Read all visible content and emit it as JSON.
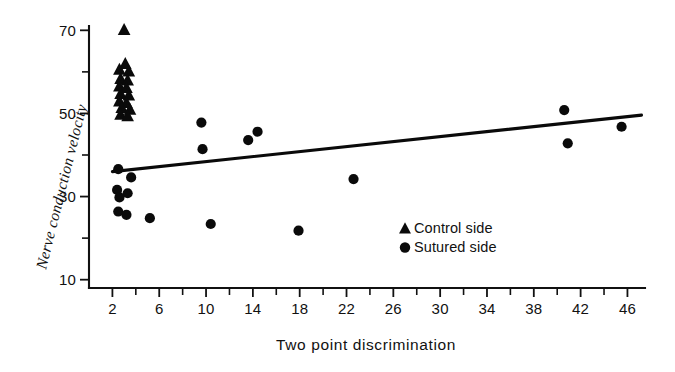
{
  "chart_data": {
    "type": "scatter",
    "title": "",
    "xlabel": "Two point discrimination",
    "ylabel": "Nerve conduction velocity",
    "xlim": [
      0,
      47.5
    ],
    "ylim": [
      8,
      72
    ],
    "grid": false,
    "legend_position": "inside-bottom-right",
    "x_ticks_labeled": [
      2,
      6,
      10,
      14,
      18,
      22,
      26,
      30,
      34,
      38,
      42,
      46
    ],
    "x_ticks_minor": [
      4,
      8,
      12,
      16,
      20,
      24,
      28,
      32,
      36,
      40,
      44
    ],
    "y_ticks_labeled": [
      10,
      30,
      50,
      70
    ],
    "y_ticks_minor": [
      20,
      40,
      60
    ],
    "x_tick_labels": [
      "2",
      "6",
      "10",
      "14",
      "18",
      "22",
      "26",
      "30",
      "34",
      "38",
      "42",
      "46"
    ],
    "y_tick_labels": [
      "10",
      "30",
      "50",
      "70"
    ],
    "series": [
      {
        "name": "Control side",
        "marker": "triangle",
        "color": "#0a0a0a",
        "points": [
          [
            3.0,
            70.2
          ],
          [
            3.1,
            62.0
          ],
          [
            2.6,
            60.6
          ],
          [
            3.4,
            60.2
          ],
          [
            2.7,
            58.4
          ],
          [
            3.3,
            58.0
          ],
          [
            2.6,
            56.6
          ],
          [
            3.2,
            56.2
          ],
          [
            2.7,
            54.8
          ],
          [
            3.4,
            54.4
          ],
          [
            2.6,
            53.0
          ],
          [
            3.2,
            52.6
          ],
          [
            2.8,
            51.4
          ],
          [
            3.5,
            51.0
          ],
          [
            2.7,
            49.8
          ],
          [
            3.3,
            49.4
          ]
        ]
      },
      {
        "name": "Sutured side",
        "marker": "circle",
        "color": "#0a0a0a",
        "points": [
          [
            2.5,
            36.6
          ],
          [
            3.6,
            34.6
          ],
          [
            2.4,
            31.6
          ],
          [
            3.3,
            30.8
          ],
          [
            2.6,
            29.8
          ],
          [
            2.5,
            26.4
          ],
          [
            3.2,
            25.6
          ],
          [
            5.2,
            24.8
          ],
          [
            9.6,
            47.8
          ],
          [
            9.7,
            41.4
          ],
          [
            10.4,
            23.4
          ],
          [
            13.6,
            43.6
          ],
          [
            14.4,
            45.6
          ],
          [
            17.9,
            21.8
          ],
          [
            22.6,
            34.2
          ],
          [
            40.6,
            50.8
          ],
          [
            40.9,
            42.8
          ],
          [
            45.5,
            46.8
          ]
        ]
      }
    ],
    "trendline": {
      "name": "regression line",
      "x_start": 2.0,
      "y_start": 36.0,
      "x_end": 47.2,
      "y_end": 49.6
    }
  },
  "legend": {
    "items": [
      {
        "marker": "triangle",
        "label": "Control side"
      },
      {
        "marker": "circle",
        "label": "Sutured side"
      }
    ]
  }
}
